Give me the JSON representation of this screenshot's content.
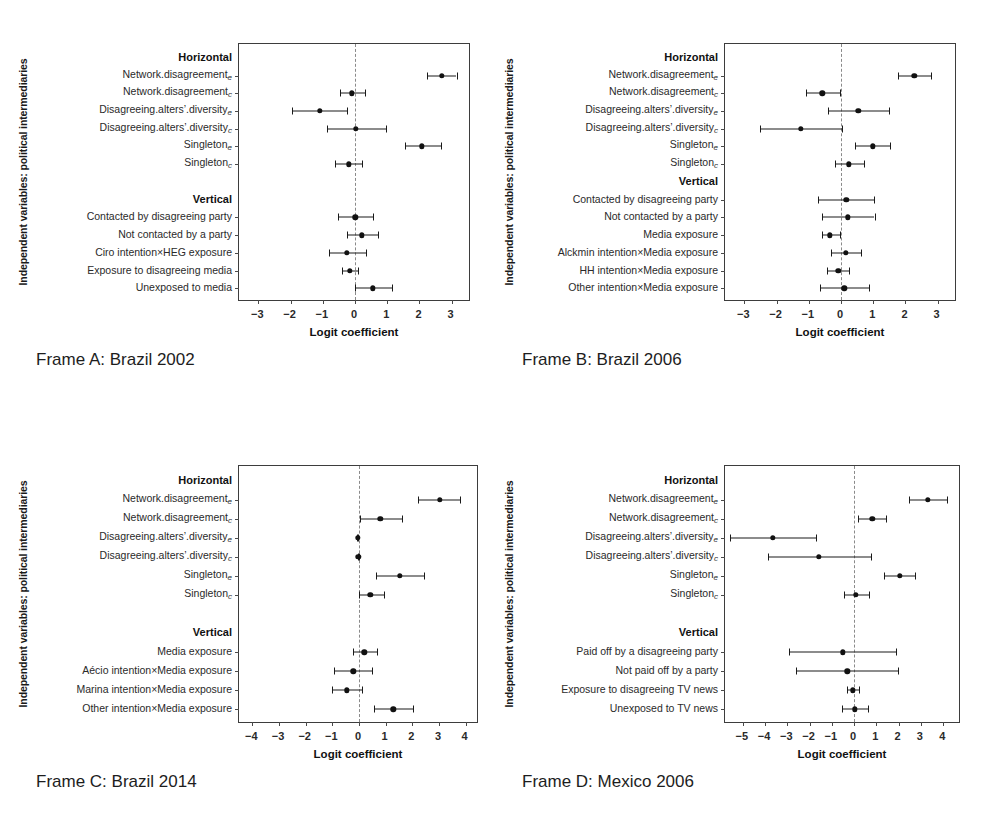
{
  "figure": {
    "shared_ylabel": "Independent variables: political intermediaries",
    "shared_xlabel": "Logit coefficient",
    "group_horizontal": "Horizontal",
    "group_vertical": "Vertical"
  },
  "chart_data": [
    {
      "id": "frame-a",
      "type": "scatter",
      "title": "Frame A: Brazil 2002",
      "xlabel": "Logit coefficient",
      "ylabel": "Independent variables: political intermediaries",
      "xlim": [
        -3.6,
        3.6
      ],
      "xticks": [
        -3,
        -2,
        -1,
        0,
        1,
        2,
        3
      ],
      "xticklabels": [
        "−3",
        "−2",
        "−1",
        "0",
        "1",
        "2",
        "3"
      ],
      "grid": false,
      "legend": null,
      "reference_line": 0,
      "groups": [
        {
          "name": "Horizontal",
          "rows": [
            {
              "label": "Network.disagreement",
              "sub": "e",
              "estimate": 2.7,
              "low": 2.22,
              "high": 3.15
            },
            {
              "label": "Network.disagreement",
              "sub": "c",
              "estimate": -0.1,
              "low": -0.48,
              "high": 0.32
            },
            {
              "label": "Disagreeing.alters’.diversity",
              "sub": "e",
              "estimate": -1.1,
              "low": -1.95,
              "high": -0.24
            },
            {
              "label": "Disagreeing.alters’.diversity",
              "sub": "c",
              "estimate": 0.03,
              "low": -0.86,
              "high": 0.95
            },
            {
              "label": "Singleton",
              "sub": "e",
              "estimate": 2.08,
              "low": 1.55,
              "high": 2.66
            },
            {
              "label": "Singleton",
              "sub": "c",
              "estimate": -0.2,
              "low": -0.63,
              "high": 0.22
            }
          ]
        },
        {
          "name": "Vertical",
          "rows": [
            {
              "label": "Contacted by disagreeing party",
              "sub": "",
              "estimate": 0.01,
              "low": -0.52,
              "high": 0.55
            },
            {
              "label": "Not contacted by a party",
              "sub": "",
              "estimate": 0.22,
              "low": -0.26,
              "high": 0.72
            },
            {
              "label": "Ciro intention×HEG exposure",
              "sub": "",
              "estimate": -0.25,
              "low": -0.82,
              "high": 0.35
            },
            {
              "label": "Exposure to disagreeing media",
              "sub": "",
              "estimate": -0.16,
              "low": -0.4,
              "high": 0.1
            },
            {
              "label": "Unexposed to media",
              "sub": "",
              "estimate": 0.55,
              "low": 0.0,
              "high": 1.14
            }
          ]
        }
      ]
    },
    {
      "id": "frame-b",
      "type": "scatter",
      "title": "Frame B: Brazil 2006",
      "xlabel": "Logit coefficient",
      "ylabel": "Independent variables: political intermediaries",
      "xlim": [
        -3.6,
        3.6
      ],
      "xticks": [
        -3,
        -2,
        -1,
        0,
        1,
        2,
        3
      ],
      "xticklabels": [
        "−3",
        "−2",
        "−1",
        "0",
        "1",
        "2",
        "3"
      ],
      "grid": false,
      "legend": null,
      "reference_line": 0,
      "groups": [
        {
          "name": "Horizontal",
          "rows": [
            {
              "label": "Network.disagreement",
              "sub": "e",
              "estimate": 2.28,
              "low": 1.76,
              "high": 2.8
            },
            {
              "label": "Network.disagreement",
              "sub": "c",
              "estimate": -0.58,
              "low": -1.08,
              "high": -0.04
            },
            {
              "label": "Disagreeing.alters’.diversity",
              "sub": "e",
              "estimate": 0.54,
              "low": -0.4,
              "high": 1.5
            },
            {
              "label": "Disagreeing.alters’.diversity",
              "sub": "c",
              "estimate": -1.25,
              "low": -2.52,
              "high": 0.04
            },
            {
              "label": "Singleton",
              "sub": "e",
              "estimate": 0.98,
              "low": 0.42,
              "high": 1.52
            },
            {
              "label": "Singleton",
              "sub": "c",
              "estimate": 0.24,
              "low": -0.18,
              "high": 0.7
            }
          ]
        },
        {
          "name": "Vertical",
          "rows": [
            {
              "label": "Contacted by disagreeing party",
              "sub": "",
              "estimate": 0.16,
              "low": -0.7,
              "high": 1.02
            },
            {
              "label": "Not contacted by a party",
              "sub": "",
              "estimate": 0.22,
              "low": -0.58,
              "high": 1.04
            },
            {
              "label": "Media exposure",
              "sub": "",
              "estimate": -0.34,
              "low": -0.6,
              "high": -0.04
            },
            {
              "label": "Alckmin intention×Media exposure",
              "sub": "",
              "estimate": 0.14,
              "low": -0.3,
              "high": 0.62
            },
            {
              "label": "HH intention×Media exposure",
              "sub": "",
              "estimate": -0.08,
              "low": -0.44,
              "high": 0.26
            },
            {
              "label": "Other intention×Media exposure",
              "sub": "",
              "estimate": 0.1,
              "low": -0.66,
              "high": 0.88
            }
          ]
        }
      ]
    },
    {
      "id": "frame-c",
      "type": "scatter",
      "title": "Frame C: Brazil 2014",
      "xlabel": "Logit coefficient",
      "ylabel": "Independent variables: political intermediaries",
      "xlim": [
        -4.5,
        4.5
      ],
      "xticks": [
        -4,
        -3,
        -2,
        -1,
        0,
        1,
        2,
        3,
        4
      ],
      "xticklabels": [
        "−4",
        "−3",
        "−2",
        "−1",
        "0",
        "1",
        "2",
        "3",
        "4"
      ],
      "grid": false,
      "legend": null,
      "reference_line": 0,
      "groups": [
        {
          "name": "Horizontal",
          "rows": [
            {
              "label": "Network.disagreement",
              "sub": "e",
              "estimate": 3.02,
              "low": 2.22,
              "high": 3.8
            },
            {
              "label": "Network.disagreement",
              "sub": "c",
              "estimate": 0.8,
              "low": 0.02,
              "high": 1.6
            },
            {
              "label": "Disagreeing.alters’.diversity",
              "sub": "e",
              "estimate": -0.04,
              "low": -0.06,
              "high": -0.02
            },
            {
              "label": "Disagreeing.alters’.diversity",
              "sub": "c",
              "estimate": -0.02,
              "low": -0.04,
              "high": 0.0
            },
            {
              "label": "Singleton",
              "sub": "e",
              "estimate": 1.52,
              "low": 0.62,
              "high": 2.42
            },
            {
              "label": "Singleton",
              "sub": "c",
              "estimate": 0.42,
              "low": 0.0,
              "high": 0.92
            }
          ]
        },
        {
          "name": "Vertical",
          "rows": [
            {
              "label": "Media exposure",
              "sub": "",
              "estimate": 0.2,
              "low": -0.24,
              "high": 0.66
            },
            {
              "label": "Aécio intention×Media exposure",
              "sub": "",
              "estimate": -0.22,
              "low": -0.94,
              "high": 0.5
            },
            {
              "label": "Marina intention×Media exposure",
              "sub": "",
              "estimate": -0.46,
              "low": -1.02,
              "high": 0.1
            },
            {
              "label": "Other intention×Media exposure",
              "sub": "",
              "estimate": 1.28,
              "low": 0.56,
              "high": 2.02
            }
          ]
        }
      ]
    },
    {
      "id": "frame-d",
      "type": "scatter",
      "title": "Frame D: Mexico 2006",
      "xlabel": "Logit coefficient",
      "ylabel": "Independent variables: political intermediaries",
      "xlim": [
        -5.8,
        4.8
      ],
      "xticks": [
        -5,
        -4,
        -3,
        -2,
        -1,
        0,
        1,
        2,
        3,
        4
      ],
      "xticklabels": [
        "−5",
        "−4",
        "−3",
        "−2",
        "−1",
        "0",
        "1",
        "2",
        "3",
        "4"
      ],
      "grid": false,
      "legend": null,
      "reference_line": 0,
      "groups": [
        {
          "name": "Horizontal",
          "rows": [
            {
              "label": "Network.disagreement",
              "sub": "e",
              "estimate": 3.32,
              "low": 2.48,
              "high": 4.18
            },
            {
              "label": "Network.disagreement",
              "sub": "c",
              "estimate": 0.82,
              "low": 0.18,
              "high": 1.44
            },
            {
              "label": "Disagreeing.alters’.diversity",
              "sub": "e",
              "estimate": -3.66,
              "low": -5.56,
              "high": -1.72
            },
            {
              "label": "Disagreeing.alters’.diversity",
              "sub": "c",
              "estimate": -1.58,
              "low": -3.86,
              "high": 0.74
            },
            {
              "label": "Singleton",
              "sub": "e",
              "estimate": 2.04,
              "low": 1.34,
              "high": 2.72
            },
            {
              "label": "Singleton",
              "sub": "c",
              "estimate": 0.08,
              "low": -0.46,
              "high": 0.66
            }
          ]
        },
        {
          "name": "Vertical",
          "rows": [
            {
              "label": "Paid off by a disagreeing party",
              "sub": "",
              "estimate": -0.52,
              "low": -2.94,
              "high": 1.9
            },
            {
              "label": "Not paid off by a party",
              "sub": "",
              "estimate": -0.3,
              "low": -2.62,
              "high": 1.96
            },
            {
              "label": "Exposure to disagreeing TV news",
              "sub": "",
              "estimate": -0.06,
              "low": -0.34,
              "high": 0.24
            },
            {
              "label": "Unexposed to TV news",
              "sub": "",
              "estimate": 0.02,
              "low": -0.56,
              "high": 0.64
            }
          ]
        }
      ]
    }
  ],
  "layout": {
    "panels": [
      {
        "id": "frame-a",
        "left": 14,
        "top": 40,
        "labels_right": 232,
        "box_left": 238,
        "box_top": 43,
        "box_width": 232,
        "box_height": 258,
        "caption_left": 36,
        "caption_top": 350,
        "gap_after_horizontal": true
      },
      {
        "id": "frame-b",
        "left": 500,
        "top": 40,
        "labels_right": 718,
        "box_left": 724,
        "box_top": 43,
        "box_width": 232,
        "box_height": 258,
        "caption_left": 522,
        "caption_top": 350,
        "gap_after_horizontal": false
      },
      {
        "id": "frame-c",
        "left": 14,
        "top": 462,
        "labels_right": 232,
        "box_left": 238,
        "box_top": 465,
        "box_width": 240,
        "box_height": 258,
        "caption_left": 36,
        "caption_top": 772,
        "gap_after_horizontal": true
      },
      {
        "id": "frame-d",
        "left": 500,
        "top": 462,
        "labels_right": 718,
        "box_left": 724,
        "box_top": 465,
        "box_width": 236,
        "box_height": 258,
        "caption_left": 522,
        "caption_top": 772,
        "gap_after_horizontal": true
      }
    ]
  }
}
